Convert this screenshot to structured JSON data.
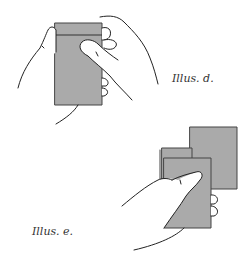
{
  "illustrations": [
    {
      "id": "d",
      "caption": "Illus. d.",
      "description": "Two hands holding a small grey card/booklet; thumb pressing on front"
    },
    {
      "id": "e",
      "caption": "Illus. e.",
      "description": "One hand holding two overlapping grey cards, the front card gripped by thumb"
    }
  ],
  "colors": {
    "card_fill": "#aaaaaa",
    "line": "#222222",
    "background": "#ffffff"
  }
}
